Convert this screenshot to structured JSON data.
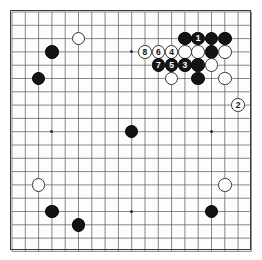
{
  "app": {
    "title": "Go Board Diagram",
    "board_size": 19,
    "colors": {
      "black_stone": "#141414",
      "white_stone": "#ffffff",
      "stone_outline": "#333333",
      "grid_line": "#555555",
      "border": "#3a3a3a",
      "background": "#ffffff",
      "black_label_text": "#ffffff",
      "white_label_text": "#111111"
    }
  },
  "geometry": {
    "origin_x": 12,
    "origin_y": 12,
    "spacing": 13.3,
    "stone_diameter": 13.6,
    "hoshi_diameter": 3.2,
    "label_font_size": 8.5
  },
  "hoshi_points": [
    {
      "col": 4,
      "row": 4
    },
    {
      "col": 10,
      "row": 4
    },
    {
      "col": 16,
      "row": 4
    },
    {
      "col": 4,
      "row": 10
    },
    {
      "col": 10,
      "row": 10
    },
    {
      "col": 16,
      "row": 10
    },
    {
      "col": 4,
      "row": 16
    },
    {
      "col": 10,
      "row": 16
    },
    {
      "col": 16,
      "row": 16
    }
  ],
  "stones": [
    {
      "col": 6,
      "row": 3,
      "color": "white",
      "label": ""
    },
    {
      "col": 4,
      "row": 4,
      "color": "black",
      "label": ""
    },
    {
      "col": 3,
      "row": 6,
      "color": "black",
      "label": ""
    },
    {
      "col": 14,
      "row": 3,
      "color": "black",
      "label": ""
    },
    {
      "col": 15,
      "row": 3,
      "color": "black",
      "label": "1"
    },
    {
      "col": 16,
      "row": 3,
      "color": "black",
      "label": ""
    },
    {
      "col": 17,
      "row": 3,
      "color": "black",
      "label": ""
    },
    {
      "col": 11,
      "row": 4,
      "color": "white",
      "label": "8"
    },
    {
      "col": 12,
      "row": 4,
      "color": "white",
      "label": "6"
    },
    {
      "col": 13,
      "row": 4,
      "color": "white",
      "label": "4"
    },
    {
      "col": 14,
      "row": 4,
      "color": "white",
      "label": ""
    },
    {
      "col": 15,
      "row": 4,
      "color": "white",
      "label": ""
    },
    {
      "col": 16,
      "row": 4,
      "color": "black",
      "label": ""
    },
    {
      "col": 17,
      "row": 4,
      "color": "white",
      "label": ""
    },
    {
      "col": 12,
      "row": 5,
      "color": "black",
      "label": "7"
    },
    {
      "col": 13,
      "row": 5,
      "color": "black",
      "label": "5"
    },
    {
      "col": 14,
      "row": 5,
      "color": "black",
      "label": "3"
    },
    {
      "col": 15,
      "row": 5,
      "color": "black",
      "label": ""
    },
    {
      "col": 16,
      "row": 5,
      "color": "white",
      "label": ""
    },
    {
      "col": 13,
      "row": 6,
      "color": "white",
      "label": ""
    },
    {
      "col": 15,
      "row": 6,
      "color": "black",
      "label": ""
    },
    {
      "col": 17,
      "row": 6,
      "color": "white",
      "label": ""
    },
    {
      "col": 18,
      "row": 8,
      "color": "white",
      "label": "2"
    },
    {
      "col": 10,
      "row": 10,
      "color": "black",
      "label": ""
    },
    {
      "col": 3,
      "row": 14,
      "color": "white",
      "label": ""
    },
    {
      "col": 17,
      "row": 14,
      "color": "white",
      "label": ""
    },
    {
      "col": 4,
      "row": 16,
      "color": "black",
      "label": ""
    },
    {
      "col": 16,
      "row": 16,
      "color": "black",
      "label": ""
    },
    {
      "col": 6,
      "row": 17,
      "color": "black",
      "label": ""
    }
  ],
  "move_sequence": [
    {
      "number": "1",
      "color": "black"
    },
    {
      "number": "2",
      "color": "white"
    },
    {
      "number": "3",
      "color": "black"
    },
    {
      "number": "4",
      "color": "white"
    },
    {
      "number": "5",
      "color": "black"
    },
    {
      "number": "6",
      "color": "white"
    },
    {
      "number": "7",
      "color": "black"
    },
    {
      "number": "8",
      "color": "white"
    }
  ]
}
